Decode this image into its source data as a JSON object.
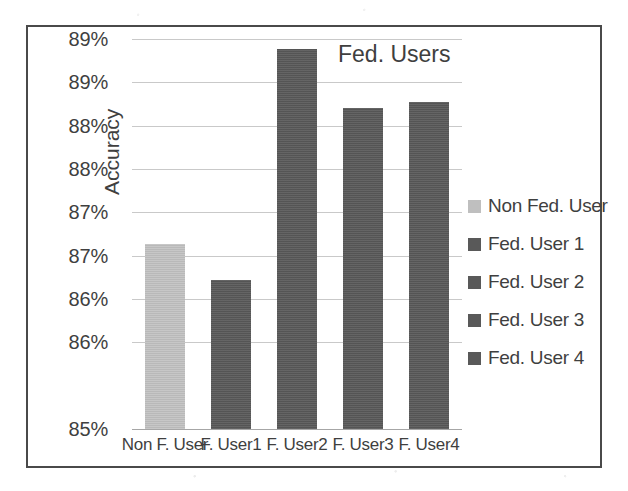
{
  "chart_data": {
    "type": "bar",
    "title": "Fed. Users",
    "xlabel": "",
    "ylabel": "Accuracy",
    "categories": [
      "Non F. User",
      "F. User1",
      "F. User2",
      "F. User3",
      "F. User4"
    ],
    "values": [
      87.14,
      86.72,
      89.39,
      88.7,
      88.77
    ],
    "series": [
      {
        "name": "Accuracy",
        "values": [
          87.14,
          86.72,
          89.39,
          88.7,
          88.77
        ]
      }
    ],
    "ylim": [
      85,
      89.5
    ],
    "y_tick_values": [
      89.5,
      89.0,
      88.5,
      88.0,
      87.5,
      87.0,
      86.5,
      86.0,
      85.0
    ],
    "y_tick_labels": [
      "89%",
      "89%",
      "88%",
      "88%",
      "87%",
      "87%",
      "86%",
      "86%",
      "85%"
    ],
    "grid": true,
    "legend_position": "right",
    "legend": [
      {
        "label": "Non Fed. User",
        "color": "#bfbfbf"
      },
      {
        "label": "Fed. User 1",
        "color": "#595959"
      },
      {
        "label": "Fed. User 2",
        "color": "#595959"
      },
      {
        "label": "Fed. User 3",
        "color": "#595959"
      },
      {
        "label": "Fed. User 4",
        "color": "#595959"
      }
    ],
    "bar_colors": [
      "#bfbfbf",
      "#595959",
      "#595959",
      "#595959",
      "#595959"
    ]
  },
  "colors": {
    "frame_border": "#4a4a4a",
    "gridline": "#c9c9c9",
    "baseline": "#a6a6a6",
    "text": "#3f3f3f",
    "bar_light": "#bfbfbf",
    "bar_dark": "#595959",
    "background": "#ffffff"
  }
}
